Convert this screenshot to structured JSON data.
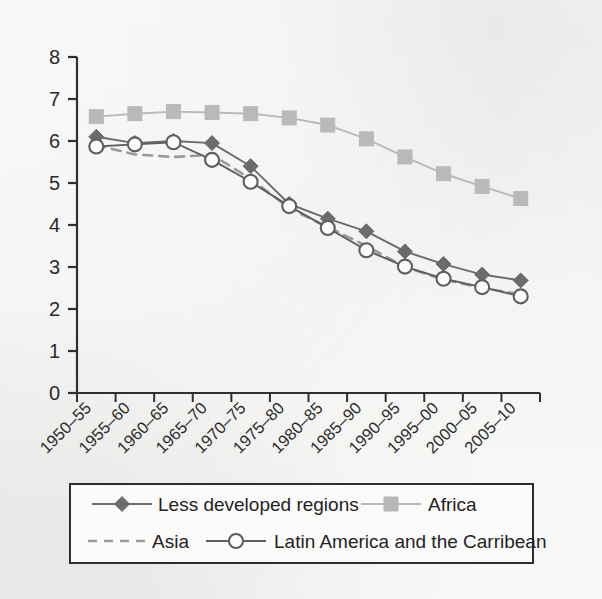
{
  "chart_data": {
    "type": "line",
    "title": "",
    "xlabel": "",
    "ylabel": "",
    "ylim": [
      0,
      8
    ],
    "yticks": [
      "0",
      "1",
      "2",
      "3",
      "4",
      "5",
      "6",
      "7",
      "8"
    ],
    "grid": false,
    "legend_position": "bottom",
    "categories": [
      "1950–55",
      "1955–60",
      "1960–65",
      "1965–70",
      "1970–75",
      "1975–80",
      "1980–85",
      "1985–90",
      "1990–95",
      "1995–00",
      "2000–05",
      "2005–10"
    ],
    "series": [
      {
        "name": "Less developed regions",
        "marker": "diamond",
        "line_style": "solid",
        "color": "#6b6b6b",
        "values": [
          6.1,
          5.95,
          6.0,
          5.95,
          5.4,
          4.5,
          4.15,
          3.85,
          3.37,
          3.07,
          2.82,
          2.68
        ]
      },
      {
        "name": "Africa",
        "marker": "square",
        "line_style": "solid",
        "color": "#b9b9b9",
        "values": [
          6.58,
          6.65,
          6.7,
          6.68,
          6.65,
          6.55,
          6.38,
          6.05,
          5.62,
          5.22,
          4.92,
          4.63
        ]
      },
      {
        "name": "Asia",
        "marker": "none",
        "line_style": "dashed",
        "color": "#9a9a9a",
        "values": [
          5.9,
          5.68,
          5.62,
          5.67,
          5.1,
          4.4,
          3.95,
          3.5,
          3.0,
          2.7,
          2.5,
          2.35
        ]
      },
      {
        "name": "Latin America and the Carribean",
        "marker": "circle-open",
        "line_style": "solid",
        "color": "#5e5e5e",
        "values": [
          5.87,
          5.92,
          5.97,
          5.55,
          5.03,
          4.45,
          3.93,
          3.4,
          3.01,
          2.72,
          2.52,
          2.3
        ]
      }
    ]
  },
  "legend": {
    "items": [
      {
        "label": "Less developed regions",
        "marker": "diamond",
        "line_style": "solid"
      },
      {
        "label": "Africa",
        "marker": "square",
        "line_style": "solid"
      },
      {
        "label": "Asia",
        "marker": "none",
        "line_style": "dashed"
      },
      {
        "label": "Latin America and the Carribean",
        "marker": "circle-open",
        "line_style": "solid"
      }
    ]
  }
}
